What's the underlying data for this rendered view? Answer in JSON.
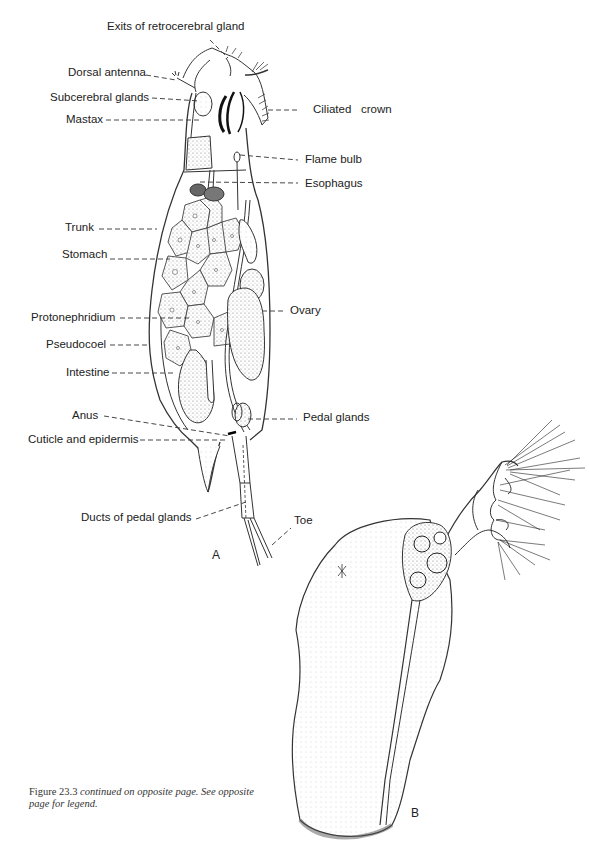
{
  "figure": {
    "panel_a": {
      "letter": "A",
      "labels": {
        "exits_retrocerebral": "Exits of retrocerebral gland",
        "dorsal_antenna": "Dorsal antenna",
        "subcerebral_glands": "Subcerebral glands",
        "mastax": "Mastax",
        "ciliated_crown": "Ciliated   crown",
        "flame_bulb": "Flame bulb",
        "esophagus": "Esophagus",
        "trunk": "Trunk",
        "stomach": "Stomach",
        "protonephridium": "Protonephridium",
        "pseudocoel": "Pseudocoel",
        "intestine": "Intestine",
        "ovary": "Ovary",
        "anus": "Anus",
        "cuticle_epidermis": "Cuticle and epidermis",
        "pedal_glands": "Pedal glands",
        "ducts_pedal_glands": "Ducts of pedal glands",
        "toe": "Toe"
      }
    },
    "panel_b": {
      "letter": "B"
    },
    "caption": {
      "figure_number": "Figure 23.3",
      "text": " continued on opposite page. See opposite page for legend."
    }
  }
}
